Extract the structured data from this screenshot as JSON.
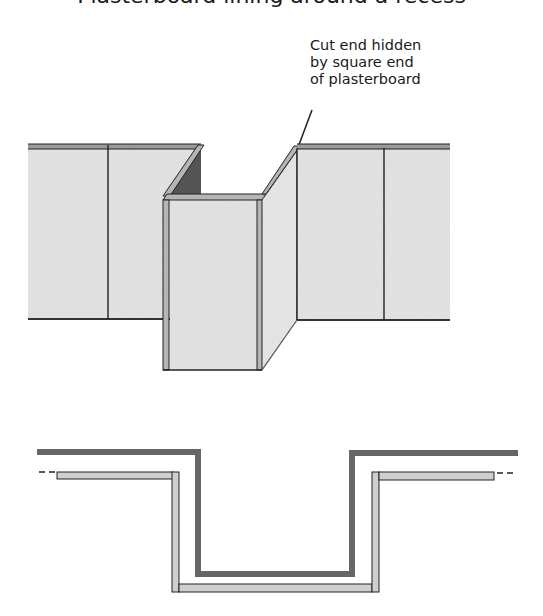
{
  "title_partial": "Plasterboard lining around a recess",
  "callout": {
    "lines": [
      "Cut end hidden",
      "by square end",
      "of plasterboard"
    ]
  },
  "colors": {
    "board_fill": "#e6e6e6",
    "board_edge": "#9a9a9a",
    "outline": "#222222",
    "shadow": "#555555",
    "wall_plan": "#666666",
    "board_plan": "#cfcfcf"
  },
  "views": {
    "elevation": "3D view of plasterboard lining wrapped around a projecting recess",
    "plan": "Plan section showing wall and plasterboard lining around recess"
  }
}
